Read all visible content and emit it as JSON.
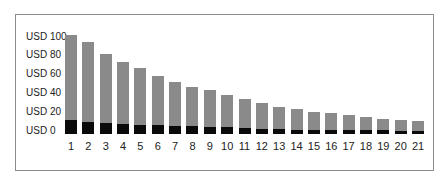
{
  "chart_data": {
    "type": "bar",
    "stacked": true,
    "title": "",
    "xlabel": "",
    "ylabel": "",
    "ylim": [
      0,
      100
    ],
    "y_ticks": [
      "USD 0",
      "USD 20",
      "USD 40",
      "USD 60",
      "USD 80",
      "USD 100"
    ],
    "y_tick_values": [
      0,
      20,
      40,
      60,
      80,
      100
    ],
    "categories": [
      "1",
      "2",
      "3",
      "4",
      "5",
      "6",
      "7",
      "8",
      "9",
      "10",
      "11",
      "12",
      "13",
      "14",
      "15",
      "16",
      "17",
      "18",
      "19",
      "20",
      "21"
    ],
    "series": [
      {
        "name": "base",
        "color": "#0a0a0a",
        "values": [
          15,
          13,
          12,
          11,
          10,
          9.5,
          8.5,
          8,
          7.5,
          7,
          6.5,
          5.5,
          5,
          4.5,
          4.5,
          4,
          4,
          4,
          4,
          3.5,
          3.5
        ]
      },
      {
        "name": "remainder",
        "color": "#8a8a8a",
        "values": [
          90,
          85,
          73,
          66,
          60,
          52.5,
          46.5,
          42,
          39.5,
          35,
          30.5,
          27.5,
          24,
          22.5,
          18.5,
          18,
          16,
          14,
          12,
          11.5,
          10.5
        ]
      }
    ],
    "totals": [
      105,
      98,
      85,
      77,
      70,
      62,
      55,
      50,
      47,
      42,
      37,
      33,
      29,
      27,
      23,
      22,
      20,
      18,
      16,
      15,
      14
    ],
    "grid": false,
    "legend": "none"
  }
}
